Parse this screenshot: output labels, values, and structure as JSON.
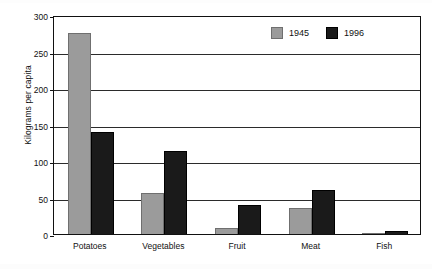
{
  "chart_data": {
    "type": "bar",
    "title": "",
    "xlabel": "",
    "ylabel": "Kilograms per capita",
    "categories": [
      "Potatoes",
      "Vegetables",
      "Fruit",
      "Meat",
      "Fish"
    ],
    "series": [
      {
        "name": "1945",
        "color": "#9b9b9b",
        "values": [
          277,
          57,
          9,
          37,
          2
        ]
      },
      {
        "name": "1996",
        "color": "#1a1a1a",
        "values": [
          141,
          115,
          41,
          62,
          5
        ]
      }
    ],
    "ylim": [
      0,
      300
    ],
    "yticks": [
      0,
      50,
      100,
      150,
      200,
      250,
      300
    ],
    "ytick_labels": [
      "0",
      "50",
      "100",
      "150",
      "200",
      "250",
      "300"
    ],
    "grid": true,
    "grid_axis": "y",
    "legend": {
      "position": "top-right",
      "entries": [
        "1945",
        "1996"
      ]
    }
  }
}
